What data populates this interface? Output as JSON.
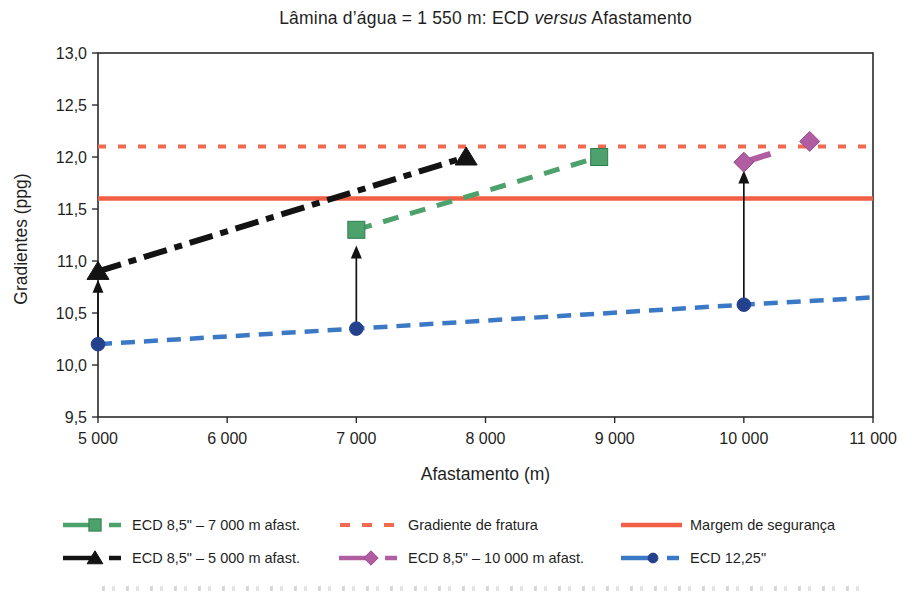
{
  "chart_data": {
    "type": "line",
    "title_prefix": "Lâmina d’água = 1 550 m: ECD ",
    "title_italic": "versus",
    "title_suffix": " Afastamento",
    "xlabel": "Afastamento (m)",
    "ylabel": "Gradientes (ppg)",
    "xlim": [
      5000,
      11000
    ],
    "ylim": [
      9.5,
      13.0
    ],
    "axis_color": "#2b2b2b",
    "text_color": "#1f1f1f",
    "arrow_color": "#131313",
    "xticks": [
      {
        "v": 5000,
        "label": "5 000"
      },
      {
        "v": 6000,
        "label": "6 000"
      },
      {
        "v": 7000,
        "label": "7 000"
      },
      {
        "v": 8000,
        "label": "8 000"
      },
      {
        "v": 9000,
        "label": "9 000"
      },
      {
        "v": 10000,
        "label": "10 000"
      },
      {
        "v": 11000,
        "label": "11 000"
      }
    ],
    "yticks": [
      {
        "v": 9.5,
        "label": "9,5"
      },
      {
        "v": 10.0,
        "label": "10,0"
      },
      {
        "v": 10.5,
        "label": "10,5"
      },
      {
        "v": 11.0,
        "label": "11,0"
      },
      {
        "v": 11.5,
        "label": "11,5"
      },
      {
        "v": 12.0,
        "label": "12,0"
      },
      {
        "v": 12.5,
        "label": "12,5"
      },
      {
        "v": 13.0,
        "label": "13,0"
      }
    ],
    "series": [
      {
        "name": "ECD 8,5\" – 7 000 m afast.",
        "color": "#4ca26a",
        "marker": "square",
        "marker_edge": "#2f7d4e",
        "line": "dashed",
        "dasharray": "16 12",
        "width": 5,
        "points": [
          [
            7000,
            11.3
          ],
          [
            8880,
            12.0
          ]
        ]
      },
      {
        "name": "Gradiente de fratura",
        "color": "#f26a50",
        "marker": "none",
        "line": "dotted",
        "dasharray": "8 12",
        "width": 4,
        "points": [
          [
            5000,
            12.1
          ],
          [
            11000,
            12.1
          ]
        ]
      },
      {
        "name": "Margem de segurança",
        "color": "#f15f45",
        "marker": "none",
        "line": "solid",
        "dasharray": "",
        "width": 4.5,
        "points": [
          [
            5000,
            11.6
          ],
          [
            11000,
            11.6
          ]
        ]
      },
      {
        "name": "ECD 8,5\" – 5 000 m afast.",
        "color": "#131313",
        "marker": "triangle",
        "marker_edge": "#131313",
        "line": "dashdot",
        "dasharray": "24 8 8 8",
        "width": 6,
        "points": [
          [
            5000,
            10.9
          ],
          [
            7850,
            12.0
          ]
        ]
      },
      {
        "name": "ECD 8,5\" – 10 000 m afast.",
        "color": "#b15da1",
        "marker": "diamond",
        "marker_edge": "#9c4d8d",
        "line": "dashed",
        "dasharray": "28 40",
        "width": 6,
        "points": [
          [
            10000,
            11.95
          ],
          [
            10510,
            12.15
          ]
        ]
      },
      {
        "name": "ECD 12,25\"",
        "color": "#3b78c5",
        "marker": "circle",
        "marker_fill": "#24418d",
        "marker_edge": "#24418d",
        "line": "dashed",
        "dasharray": "14 9",
        "width": 4.5,
        "points": [
          [
            5000,
            10.2
          ],
          [
            7000,
            10.35
          ],
          [
            10000,
            10.58
          ],
          [
            11000,
            10.65
          ]
        ],
        "marker_points": [
          [
            5000,
            10.2
          ],
          [
            7000,
            10.35
          ],
          [
            10000,
            10.58
          ]
        ]
      }
    ],
    "arrows": [
      {
        "x": 5000,
        "from": 10.23,
        "to": 10.82
      },
      {
        "x": 7000,
        "from": 10.36,
        "to": 11.15
      },
      {
        "x": 10000,
        "from": 10.6,
        "to": 11.87
      }
    ],
    "legend": {
      "rows": [
        [
          0,
          1,
          2
        ],
        [
          3,
          4,
          5
        ]
      ],
      "col_left": [
        62,
        338,
        620
      ],
      "row_top": [
        516,
        549
      ]
    }
  }
}
